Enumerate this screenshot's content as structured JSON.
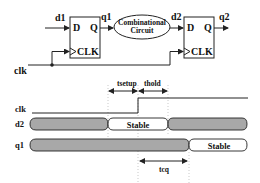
{
  "circuit": {
    "ff1": {
      "d_pin": "D",
      "q_pin": "Q",
      "clk_pin": "CLK"
    },
    "ff2": {
      "d_pin": "D",
      "q_pin": "Q",
      "clk_pin": "CLK"
    },
    "combinational": {
      "line1": "Combinational",
      "line2": "Circuit"
    },
    "signals": {
      "d1": "d1",
      "q1": "q1",
      "d2": "d2",
      "q2": "q2",
      "clk": "clk"
    }
  },
  "timing": {
    "rows": [
      {
        "label": "clk"
      },
      {
        "label": "d2",
        "stable_label": "Stable"
      },
      {
        "label": "q1",
        "stable_label": "Stable"
      }
    ],
    "annotations": {
      "tsetup": "tsetup",
      "thold": "thold",
      "tcq": "tcq"
    }
  },
  "colors": {
    "unstable_fill": "#a8a8a8",
    "stable_fill": "#ffffff",
    "stroke": "#222222"
  }
}
